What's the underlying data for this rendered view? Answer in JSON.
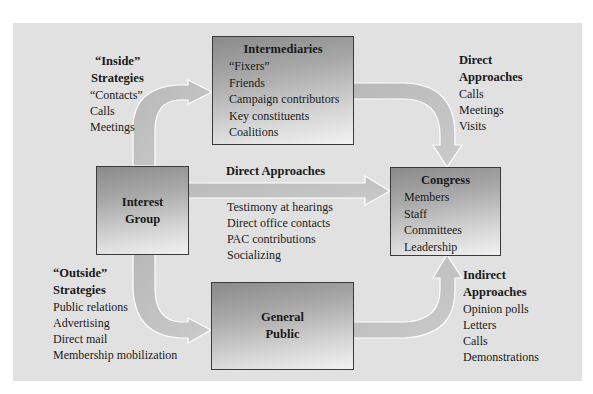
{
  "diagram": {
    "colors": {
      "background": "#ffffff",
      "panel": "#e1e1e1",
      "box_dark": "#8a8a8a",
      "box_light": "#f2f2f2",
      "arrow_fill": "#c2c2c2",
      "arrow_outline": "#ffffff"
    },
    "nodes": {
      "intermediaries": {
        "title": "Intermediaries",
        "items": [
          "“Fixers”",
          "Friends",
          "Campaign contributors",
          "Key constituents",
          "Coalitions"
        ]
      },
      "interest_group": {
        "title_line1": "Interest",
        "title_line2": "Group"
      },
      "congress": {
        "title": "Congress",
        "items": [
          "Members",
          "Staff",
          "Committees",
          "Leadership"
        ]
      },
      "general_public": {
        "title_line1": "General",
        "title_line2": "Public"
      }
    },
    "labels": {
      "inside": {
        "heading_line1": "“Inside”",
        "heading_line2": "Strategies",
        "items": [
          "“Contacts”",
          "Calls",
          "Meetings"
        ]
      },
      "direct_top_right": {
        "heading_line1": "Direct",
        "heading_line2": "Approaches",
        "items": [
          "Calls",
          "Meetings",
          "Visits"
        ]
      },
      "direct_middle": {
        "heading": "Direct Approaches",
        "items": [
          "Testimony at hearings",
          "Direct office contacts",
          "PAC contributions",
          "Socializing"
        ]
      },
      "outside": {
        "heading_line1": "“Outside”",
        "heading_line2": "Strategies",
        "items": [
          "Public relations",
          "Advertising",
          "Direct mail",
          "Membership mobilization"
        ]
      },
      "indirect": {
        "heading_line1": "Indirect",
        "heading_line2": "Approaches",
        "items": [
          "Opinion polls",
          "Letters",
          "Calls",
          "Demonstrations"
        ]
      }
    },
    "edges": [
      {
        "from": "Interest Group",
        "to": "Intermediaries",
        "label": "“Inside” Strategies"
      },
      {
        "from": "Intermediaries",
        "to": "Congress",
        "label": "Direct Approaches"
      },
      {
        "from": "Interest Group",
        "to": "Congress",
        "label": "Direct Approaches"
      },
      {
        "from": "Interest Group",
        "to": "General Public",
        "label": "“Outside” Strategies"
      },
      {
        "from": "General Public",
        "to": "Congress",
        "label": "Indirect Approaches"
      }
    ]
  }
}
